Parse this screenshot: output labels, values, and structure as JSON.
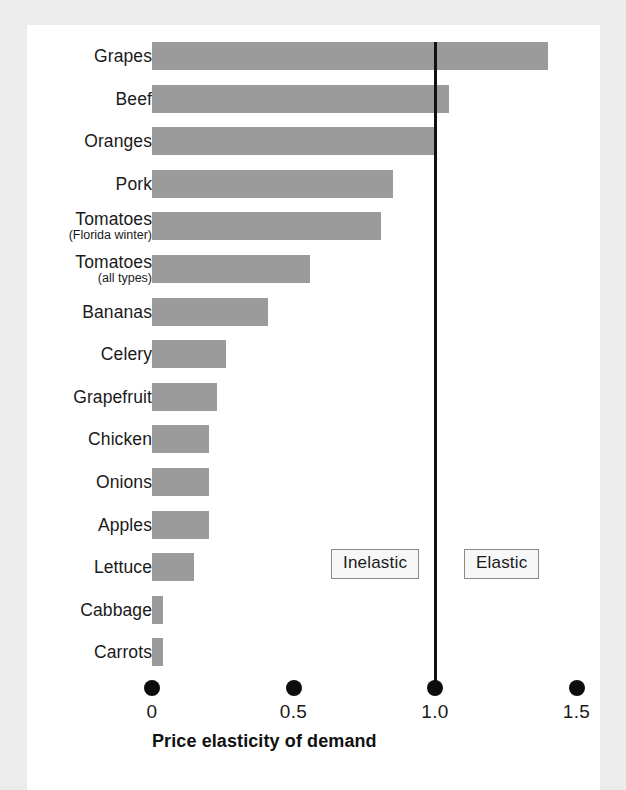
{
  "figure": {
    "background_color": "#ececed",
    "plate_color": "#ffffff",
    "bar_color": "#9b9b9b",
    "line_color": "#111111"
  },
  "annotations": {
    "inelastic_label": "Inelastic",
    "elastic_label": "Elastic"
  },
  "chart_data": {
    "type": "bar",
    "orientation": "horizontal",
    "title": "",
    "xlabel": "Price elasticity of demand",
    "ylabel": "",
    "xlim": [
      0,
      1.5
    ],
    "xticks": [
      0,
      0.5,
      1.0,
      1.5
    ],
    "xticklabels": [
      "0",
      "0.5",
      "1.0",
      "1.5"
    ],
    "grid": false,
    "legend": "none",
    "reference_line": {
      "value": 1.0,
      "label": "unit elastic boundary",
      "orientation": "vertical"
    },
    "regions": [
      {
        "label": "Inelastic",
        "range": [
          0,
          1.0
        ]
      },
      {
        "label": "Elastic",
        "range": [
          1.0,
          1.5
        ]
      }
    ],
    "categories": [
      "Grapes",
      "Beef",
      "Oranges",
      "Pork",
      "Tomatoes (Florida winter)",
      "Tomatoes (all types)",
      "Bananas",
      "Celery",
      "Grapefruit",
      "Chicken",
      "Onions",
      "Apples",
      "Lettuce",
      "Cabbage",
      "Carrots"
    ],
    "values": [
      1.4,
      1.05,
      1.0,
      0.85,
      0.81,
      0.56,
      0.41,
      0.26,
      0.23,
      0.2,
      0.2,
      0.2,
      0.15,
      0.04,
      0.04
    ],
    "bars": [
      {
        "label": "Grapes",
        "sublabel": "",
        "value": 1.4
      },
      {
        "label": "Beef",
        "sublabel": "",
        "value": 1.05
      },
      {
        "label": "Oranges",
        "sublabel": "",
        "value": 1.0
      },
      {
        "label": "Pork",
        "sublabel": "",
        "value": 0.85
      },
      {
        "label": "Tomatoes",
        "sublabel": "(Florida winter)",
        "value": 0.81
      },
      {
        "label": "Tomatoes",
        "sublabel": "(all types)",
        "value": 0.56
      },
      {
        "label": "Bananas",
        "sublabel": "",
        "value": 0.41
      },
      {
        "label": "Celery",
        "sublabel": "",
        "value": 0.26
      },
      {
        "label": "Grapefruit",
        "sublabel": "",
        "value": 0.23
      },
      {
        "label": "Chicken",
        "sublabel": "",
        "value": 0.2
      },
      {
        "label": "Onions",
        "sublabel": "",
        "value": 0.2
      },
      {
        "label": "Apples",
        "sublabel": "",
        "value": 0.2
      },
      {
        "label": "Lettuce",
        "sublabel": "",
        "value": 0.15
      },
      {
        "label": "Cabbage",
        "sublabel": "",
        "value": 0.04
      },
      {
        "label": "Carrots",
        "sublabel": "",
        "value": 0.04
      }
    ]
  }
}
